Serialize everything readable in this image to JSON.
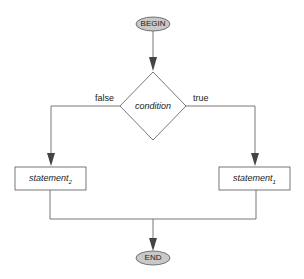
{
  "diagram": {
    "type": "flowchart",
    "nodes": {
      "begin": {
        "label": "BEGIN",
        "shape": "ellipse"
      },
      "condition": {
        "label": "condition",
        "shape": "diamond"
      },
      "statement2": {
        "label": "statement",
        "subscript": "2",
        "shape": "rectangle"
      },
      "statement1": {
        "label": "statement",
        "subscript": "1",
        "shape": "rectangle"
      },
      "end": {
        "label": "END",
        "shape": "ellipse"
      }
    },
    "edges": {
      "false_label": "false",
      "true_label": "true"
    },
    "colors": {
      "terminal_fill": "#c8c8c8",
      "line": "#555555",
      "arrow": "#444444"
    }
  }
}
